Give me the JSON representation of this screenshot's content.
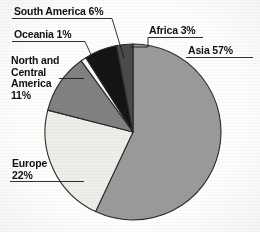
{
  "chart_data": {
    "type": "pie",
    "title": "",
    "subtitle": "",
    "xlabel": "",
    "ylabel": "",
    "legend_position": "none",
    "labels_position": "outside-with-leader-lines",
    "start_angle_deg": 0,
    "direction": "clockwise",
    "unit": "%",
    "categories": [
      "Asia",
      "Europe",
      "North and Central America",
      "Oceania",
      "South America",
      "Africa"
    ],
    "values": [
      57,
      22,
      11,
      1,
      6,
      3
    ],
    "slices": [
      {
        "name": "Asia",
        "value": 57,
        "label": "Asia 57%",
        "color": "#9a9a9a",
        "stroke": "#2b2b2b"
      },
      {
        "name": "Europe",
        "value": 22,
        "label": "Europe\n22%",
        "color": "#ededea",
        "stroke": "#2b2b2b"
      },
      {
        "name": "North and Central America",
        "value": 11,
        "label": "North and\nCentral\nAmerica\n11%",
        "color": "#818181",
        "stroke": "#2b2b2b"
      },
      {
        "name": "Oceania",
        "value": 1,
        "label": "Oceania 1%",
        "color": "#fbfbf9",
        "stroke": "#2b2b2b"
      },
      {
        "name": "South America",
        "value": 6,
        "label": "South America 6%",
        "color": "#141414",
        "stroke": "#2b2b2b"
      },
      {
        "name": "Africa",
        "value": 3,
        "label": "Africa 3%",
        "color": "#4a4a4a",
        "stroke": "#2b2b2b"
      }
    ],
    "total": 100
  },
  "labels": {
    "south_america": "South America 6%",
    "oceania": "Oceania 1%",
    "north_central_l1": "North and",
    "north_central_l2": "Central",
    "north_central_l3": "America",
    "north_central_l4": "11%",
    "europe_l1": "Europe",
    "europe_l2": "22%",
    "africa": "Africa 3%",
    "asia": "Asia 57%"
  }
}
